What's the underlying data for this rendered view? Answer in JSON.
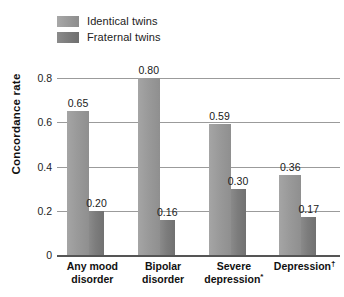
{
  "chart_data": {
    "type": "bar",
    "title": "",
    "xlabel": "",
    "ylabel": "Concordance rate",
    "ylim": [
      0,
      0.85
    ],
    "grid": true,
    "legend_position": "top-left",
    "categories": [
      "Any mood disorder",
      "Bipolar disorder",
      "Severe depression*",
      "Depression†"
    ],
    "category_lines": [
      [
        "Any mood",
        "disorder"
      ],
      [
        "Bipolar",
        "disorder"
      ],
      [
        "Severe",
        "depression*"
      ],
      [
        "Depression†",
        ""
      ]
    ],
    "yticks": [
      "0.8",
      "0.6",
      "0.4",
      "0.2",
      "0"
    ],
    "ytick_values": [
      0.8,
      0.6,
      0.4,
      0.2,
      0
    ],
    "series": [
      {
        "name": "Identical twins",
        "color": "#9a9a9a",
        "values": [
          0.65,
          0.8,
          0.59,
          0.36
        ],
        "labels": [
          "0.65",
          "0.80",
          "0.59",
          "0.36"
        ]
      },
      {
        "name": "Fraternal twins",
        "color": "#7c7c7c",
        "values": [
          0.2,
          0.16,
          0.3,
          0.17
        ],
        "labels": [
          "0.20",
          "0.16",
          "0.30",
          "0.17"
        ]
      }
    ]
  },
  "legend": {
    "items": [
      {
        "label": "Identical twins",
        "color": "#9a9a9a"
      },
      {
        "label": "Fraternal twins",
        "color": "#7c7c7c"
      }
    ]
  },
  "axis": {
    "y_title": "Concordance rate"
  }
}
